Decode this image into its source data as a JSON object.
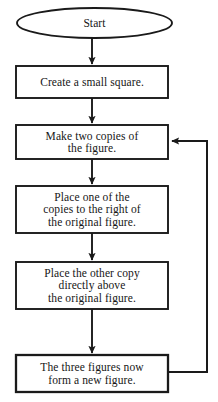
{
  "diagram": {
    "type": "flowchart",
    "orientation": "top-to-bottom",
    "stroke_color": "#1a1a1a",
    "fill_color": "#ffffff",
    "text_color": "#161616",
    "background_color": "#ffffff",
    "nodes": [
      {
        "id": "start",
        "shape": "ellipse",
        "label": "Start",
        "x": 17,
        "y": 8,
        "width": 155,
        "height": 30
      },
      {
        "id": "create-square",
        "shape": "rectangle",
        "label": "Create a small square.",
        "x": 16,
        "y": 66,
        "width": 152,
        "height": 32
      },
      {
        "id": "make-copies",
        "shape": "rectangle",
        "label": "Make two copies of\nthe figure.",
        "x": 16,
        "y": 125,
        "width": 152,
        "height": 34
      },
      {
        "id": "place-right",
        "shape": "rectangle",
        "label": "Place one of the\ncopies to the right of\nthe original figure.",
        "x": 16,
        "y": 186,
        "width": 152,
        "height": 47
      },
      {
        "id": "place-above",
        "shape": "rectangle",
        "label": "Place the other copy\ndirectly above\nthe original figure.",
        "x": 16,
        "y": 262,
        "width": 152,
        "height": 47
      },
      {
        "id": "new-figure",
        "shape": "rectangle",
        "label": "The three figures now\nform a new figure.",
        "x": 16,
        "y": 355,
        "width": 152,
        "height": 37
      }
    ],
    "edges": [
      {
        "id": "start-to-create",
        "from": "start",
        "to": "create-square",
        "kind": "straight-down",
        "arrowhead": true
      },
      {
        "id": "create-to-copies",
        "from": "create-square",
        "to": "make-copies",
        "kind": "straight-down",
        "arrowhead": true
      },
      {
        "id": "copies-to-right",
        "from": "make-copies",
        "to": "place-right",
        "kind": "straight-down",
        "arrowhead": true
      },
      {
        "id": "right-to-above",
        "from": "place-right",
        "to": "place-above",
        "kind": "straight-down",
        "arrowhead": true
      },
      {
        "id": "above-to-new",
        "from": "place-above",
        "to": "new-figure",
        "kind": "straight-down",
        "arrowhead": true
      },
      {
        "id": "loop-back",
        "from": "new-figure",
        "to": "make-copies",
        "kind": "feedback-loop-right",
        "arrowhead": true
      }
    ]
  }
}
